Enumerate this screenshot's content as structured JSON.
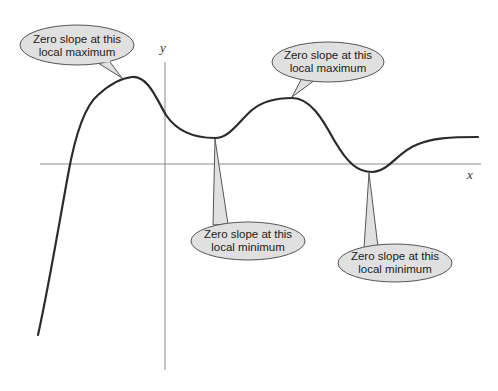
{
  "diagram": {
    "axes": {
      "x_label": "x",
      "y_label": "y"
    },
    "callouts": [
      {
        "id": "max1",
        "line1": "Zero slope at this",
        "line2": "local maximum",
        "type": "local maximum"
      },
      {
        "id": "max2",
        "line1": "Zero slope at this",
        "line2": "local maximum",
        "type": "local maximum"
      },
      {
        "id": "min1",
        "line1": "Zero slope at this",
        "line2": "local minimum",
        "type": "local minimum"
      },
      {
        "id": "min2",
        "line1": "Zero slope at this",
        "line2": "local minimum",
        "type": "local minimum"
      }
    ],
    "colors": {
      "curve": "#2b2b2b",
      "axis": "#8a8a8a",
      "bubble_fill": "#e0e0e0",
      "bubble_stroke": "#555555"
    }
  }
}
